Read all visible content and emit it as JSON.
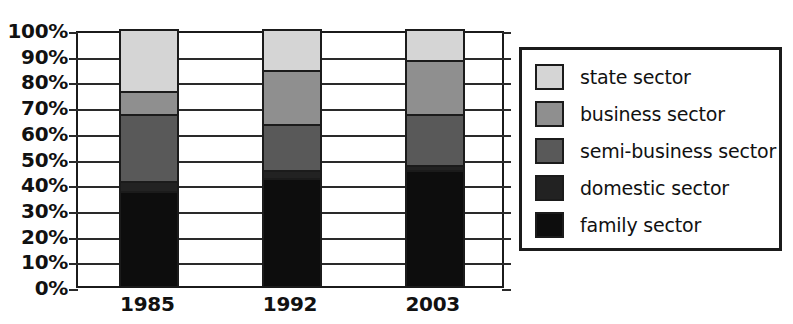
{
  "chart_data": {
    "type": "bar",
    "variant": "stacked-100-percent",
    "title": "",
    "xlabel": "",
    "ylabel": "",
    "categories": [
      "1985",
      "1992",
      "2003"
    ],
    "ylim": [
      0,
      100
    ],
    "y_ticks": [
      0,
      10,
      20,
      30,
      40,
      50,
      60,
      70,
      80,
      90,
      100
    ],
    "y_tick_labels": [
      "0%",
      "10%",
      "20%",
      "30%",
      "40%",
      "50%",
      "60%",
      "70%",
      "80%",
      "90%",
      "100%"
    ],
    "grid": true,
    "legend_position": "right",
    "units": "percent",
    "series": [
      {
        "name": "family sector",
        "color": "#0d0d0d",
        "values": [
          37,
          42,
          45
        ],
        "stack_order": 1
      },
      {
        "name": "domestic sector",
        "color": "#222222",
        "values": [
          4,
          3,
          2
        ],
        "stack_order": 2
      },
      {
        "name": "semi-business sector",
        "color": "#595959",
        "values": [
          26,
          18,
          20
        ],
        "stack_order": 3
      },
      {
        "name": "business sector",
        "color": "#8f8f8f",
        "values": [
          9,
          21,
          21
        ],
        "stack_order": 4
      },
      {
        "name": "state sector",
        "color": "#d5d5d5",
        "values": [
          24,
          16,
          12
        ],
        "stack_order": 5
      }
    ],
    "stack_tops": {
      "1985": {
        "family sector": 37,
        "domestic sector": 41,
        "semi-business sector": 67,
        "business sector": 76,
        "state sector": 100
      },
      "1992": {
        "family sector": 42,
        "domestic sector": 45,
        "semi-business sector": 63,
        "business sector": 84,
        "state sector": 100
      },
      "2003": {
        "family sector": 45,
        "domestic sector": 47,
        "semi-business sector": 67,
        "business sector": 88,
        "state sector": 100
      }
    }
  },
  "legend": {
    "items": [
      {
        "label": "state sector",
        "color": "#d5d5d5"
      },
      {
        "label": "business sector",
        "color": "#8f8f8f"
      },
      {
        "label": "semi-business sector",
        "color": "#595959"
      },
      {
        "label": "domestic sector",
        "color": "#222222"
      },
      {
        "label": "family sector",
        "color": "#0d0d0d"
      }
    ]
  },
  "axis_colors": {
    "axis_line": "#1b1b1b",
    "gridline": "#2a2a2a",
    "text": "#111111"
  }
}
